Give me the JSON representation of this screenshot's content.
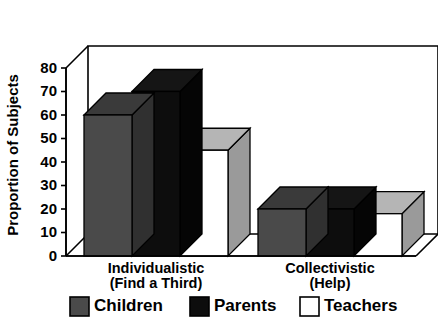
{
  "top_partial_text": "",
  "chart_data": {
    "type": "bar",
    "title": "",
    "xlabel": "",
    "ylabel": "Proportion of Subjects",
    "ylim": [
      0,
      80
    ],
    "yticks": [
      0,
      10,
      20,
      30,
      40,
      50,
      60,
      70,
      80
    ],
    "ytick_labels": [
      "0",
      "10",
      "20",
      "30",
      "40",
      "50",
      "60",
      "70",
      "80"
    ],
    "grid": false,
    "legend_position": "bottom",
    "style": "3d-grouped-bars",
    "categories": [
      "Individualistic\n(Find a Third)",
      "Collectivistic\n(Help)"
    ],
    "category_lines": [
      [
        "Individualistic",
        "(Find a Third)"
      ],
      [
        "Collectivistic",
        "(Help)"
      ]
    ],
    "series": [
      {
        "name": "Children",
        "color": "#4a4a4a",
        "values": [
          60,
          20
        ]
      },
      {
        "name": "Parents",
        "color": "#0d0d0d",
        "values": [
          70,
          20
        ]
      },
      {
        "name": "Teachers",
        "color": "#ffffff",
        "values": [
          45,
          18
        ]
      }
    ]
  },
  "legend": {
    "items": [
      {
        "label": "Children",
        "color": "#4a4a4a"
      },
      {
        "label": "Parents",
        "color": "#0d0d0d"
      },
      {
        "label": "Teachers",
        "color": "#ffffff"
      }
    ]
  },
  "colors": {
    "axis": "#000000",
    "background": "#ffffff",
    "children_front": "#4a4a4a",
    "children_top": "#3a3a3a",
    "children_side": "#303030",
    "parents_front": "#0d0d0d",
    "parents_top": "#151515",
    "parents_side": "#050505",
    "teachers_front": "#ffffff",
    "teachers_top": "#b5b5b5",
    "teachers_side": "#9a9a9a"
  }
}
